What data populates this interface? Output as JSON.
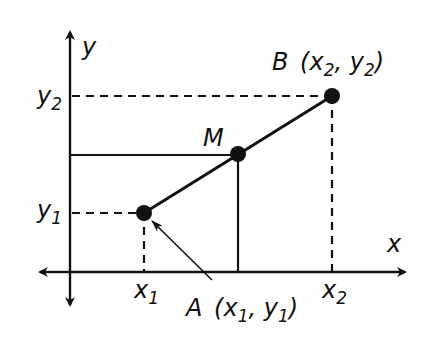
{
  "diagram": {
    "colors": {
      "ink": "#111111",
      "background": "#ffffff"
    },
    "axes": {
      "x_label": "x",
      "y_label": "y"
    },
    "points": {
      "A": {
        "name": "A",
        "coords_label": "(x1, y1)",
        "px": [
          144,
          213
        ]
      },
      "M": {
        "name": "M",
        "px": [
          238,
          154
        ]
      },
      "B": {
        "name": "B",
        "coords_label": "(x2, y2)",
        "px": [
          332,
          96
        ]
      }
    },
    "tick_labels": {
      "x1": {
        "base": "x",
        "sub": "1"
      },
      "x2": {
        "base": "x",
        "sub": "2"
      },
      "y1": {
        "base": "y",
        "sub": "1"
      },
      "y2": {
        "base": "y",
        "sub": "2"
      }
    },
    "labels": {
      "A_name": "A",
      "A_open": "(x",
      "A_sub1": "1",
      "A_mid": ", y",
      "A_sub2": "1",
      "A_close": ")",
      "B_name": "B",
      "B_open": "(x",
      "B_sub1": "2",
      "B_mid": ", y",
      "B_sub2": "2",
      "B_close": ")",
      "M_name": "M"
    }
  }
}
